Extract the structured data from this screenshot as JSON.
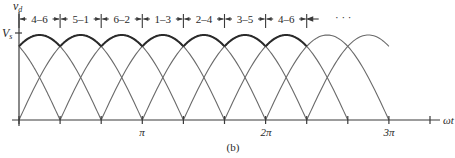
{
  "figure": {
    "caption": "(b)",
    "y_axis_label": "v",
    "y_axis_label_sub": "d",
    "peak_label": "V",
    "peak_label_sub": "s",
    "x_axis_label": "ωt",
    "x_tick_labels": [
      "π",
      "2π",
      "3π"
    ],
    "intervals": [
      "4–6",
      "5–1",
      "6–2",
      "1–3",
      "2–4",
      "3–5",
      "4–6"
    ],
    "continuation": "· · ·",
    "colors": {
      "curve_thin": "#6a6a6a",
      "curve_output": "#2a2a2a",
      "axis": "#3a3a3a"
    }
  },
  "chart_data": {
    "type": "line",
    "title": "",
    "xlabel": "ωt",
    "ylabel": "v_d",
    "x_ticks": [
      "π",
      "2π",
      "3π"
    ],
    "interval_labels": [
      "4–6",
      "5–1",
      "6–2",
      "1–3",
      "2–4",
      "3–5",
      "4–6"
    ],
    "interval_width": "π/3",
    "peak": "V_s",
    "grid": false
  }
}
